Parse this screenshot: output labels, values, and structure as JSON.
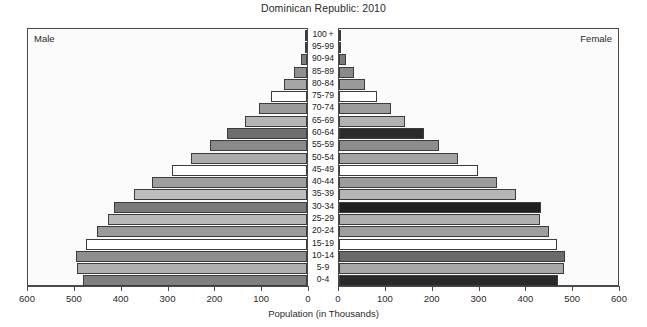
{
  "chart_title": "Dominican Republic: 2010",
  "panels": {
    "male_label": "Male",
    "female_label": "Female"
  },
  "axis": {
    "xlabel": "Population (in Thousands)",
    "ticks_male": [
      "600",
      "500",
      "400",
      "300",
      "200",
      "100",
      "0"
    ],
    "ticks_female": [
      "0",
      "100",
      "200",
      "300",
      "400",
      "500",
      "600"
    ]
  },
  "chart_data": {
    "type": "bar",
    "subtype": "population-pyramid",
    "title": "Dominican Republic: 2010",
    "xlabel": "Population (in Thousands)",
    "ylabel": "",
    "xlim": [
      0,
      600
    ],
    "grid": false,
    "legend": "none",
    "categories": [
      "0-4",
      "5-9",
      "10-14",
      "15-19",
      "20-24",
      "25-29",
      "30-34",
      "35-39",
      "40-44",
      "45-49",
      "50-54",
      "55-59",
      "60-64",
      "65-69",
      "70-74",
      "75-79",
      "80-84",
      "85-89",
      "90-94",
      "95-99",
      "100+"
    ],
    "series": [
      {
        "name": "Male",
        "side": "left",
        "values": [
          478,
          492,
          494,
          472,
          449,
          424,
          412,
          370,
          330,
          288,
          247,
          208,
          170,
          133,
          103,
          76,
          50,
          28,
          13,
          4,
          1
        ],
        "colors": [
          "#7f7f7f",
          "#b0b0b0",
          "#8e8e8e",
          "#ffffff",
          "#9a9a9a",
          "#b8b8b8",
          "#7a7a7a",
          "#bdbdbd",
          "#9e9e9e",
          "#ffffff",
          "#ababab",
          "#8a8a8a",
          "#6e6e6e",
          "#b5b5b5",
          "#9a9a9a",
          "#ffffff",
          "#a5a5a5",
          "#8f8f8f",
          "#7d7d7d",
          "#a0a0a0",
          "#8c8c8c"
        ]
      },
      {
        "name": "Female",
        "side": "right",
        "values": [
          468,
          480,
          483,
          465,
          448,
          430,
          432,
          378,
          338,
          296,
          255,
          214,
          182,
          140,
          110,
          82,
          56,
          32,
          15,
          5,
          1
        ],
        "colors": [
          "#2a2a2a",
          "#a8a8a8",
          "#6a6a6a",
          "#ffffff",
          "#9e9e9e",
          "#b0b0b0",
          "#1f1f1f",
          "#b5b5b5",
          "#9c9c9c",
          "#ffffff",
          "#a3a3a3",
          "#8d8d8d",
          "#2b2b2b",
          "#b2b2b2",
          "#9b9b9b",
          "#ffffff",
          "#9a9a9a",
          "#8a8a8a",
          "#7a7a7a",
          "#9e9e9e",
          "#8c8c8c"
        ]
      }
    ]
  }
}
